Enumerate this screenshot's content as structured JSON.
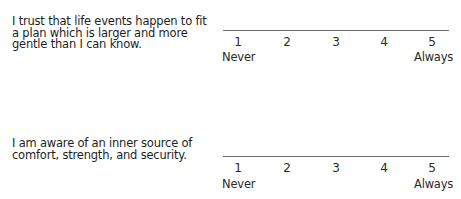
{
  "items": [
    {
      "question": "I trust that life events happen to fit a plan which is larger and more gentle than I can know.",
      "scale": [
        "1",
        "2",
        "3",
        "4",
        "5"
      ],
      "low_label": "Never",
      "high_label": "Always"
    },
    {
      "question": "I am aware of an inner source of comfort, strength, and security.",
      "scale": [
        "1",
        "2",
        "3",
        "4",
        "5"
      ],
      "low_label": "Never",
      "high_label": "Always"
    }
  ]
}
